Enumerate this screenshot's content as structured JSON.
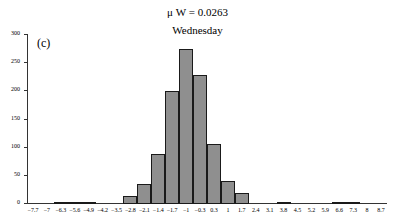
{
  "chart_data": {
    "type": "bar",
    "title_display": "μ W = 0.0263",
    "subtitle": "Wednesday",
    "panel_label": "(c)",
    "xlabel": "",
    "ylabel": "",
    "ylim": [
      0,
      300
    ],
    "yticks": [
      0,
      50,
      100,
      150,
      200,
      250,
      300
    ],
    "grid": false,
    "legend": null,
    "categories": [
      "−7.7",
      "−7",
      "−6.3",
      "−5.6",
      "−4.9",
      "−4.2",
      "−3.5",
      "−2.8",
      "−2.1",
      "−1.4",
      "−1.7",
      "−1",
      "−0.3",
      "0.3",
      "1",
      "1.7",
      "2.4",
      "3.1",
      "3.8",
      "4.5",
      "5.2",
      "5.9",
      "6.6",
      "7.3",
      "8",
      "8.7"
    ],
    "values": [
      0,
      0,
      1,
      1,
      2,
      0,
      0,
      13,
      33,
      87,
      199,
      274,
      228,
      105,
      39,
      17,
      0,
      0,
      1,
      0,
      0,
      0,
      1,
      1,
      0,
      0
    ],
    "bar_color": "#8f8f8f",
    "bar_edge_color": "#1a1a1a"
  }
}
